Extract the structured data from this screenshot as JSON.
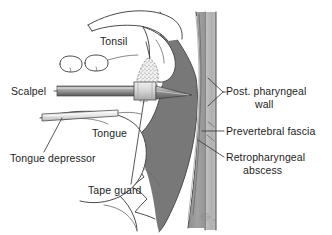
{
  "figure": {
    "background_color": "#ffffff",
    "width": 332,
    "height": 235
  },
  "colors": {
    "abscess_fill": "#787878",
    "pharyngeal_wall_fill": "#9a9a9a",
    "vertebral_band_fill": "#b4b4b4",
    "soft_tissue_fill": "#ffffff",
    "outline": "#4a4a4a",
    "leader_line": "#3a3a3a",
    "text": "#1d1d1d",
    "scalpel_handle": "#8e8e8e",
    "tape_guard": "#d8d8d8"
  },
  "labels": {
    "tonsil": "Tonsil",
    "scalpel": "Scalpel",
    "tongue": "Tongue",
    "tongue_depressor": "Tongue depressor",
    "tape_guard": "Tape guard",
    "post_pharyngeal_wall_line1": "Post. pharyngeal",
    "post_pharyngeal_wall_line2": "wall",
    "prevertebral_fascia": "Prevertebral fascia",
    "retropharyngeal_abscess_line1": "Retropharyngeal",
    "retropharyngeal_abscess_line2": "abscess"
  },
  "artifact": {
    "mark": "⇧"
  },
  "structures": [
    {
      "name": "hard-palate",
      "type": "outline"
    },
    {
      "name": "soft-palate",
      "type": "outline"
    },
    {
      "name": "uvula",
      "type": "outline"
    },
    {
      "name": "teeth",
      "type": "outline",
      "count": 2
    },
    {
      "name": "tonsil",
      "type": "stippled"
    },
    {
      "name": "tongue",
      "type": "outline"
    },
    {
      "name": "epiglottis",
      "type": "outline"
    },
    {
      "name": "posterior-pharyngeal-wall",
      "type": "filled"
    },
    {
      "name": "retropharyngeal-abscess",
      "type": "filled-dark"
    },
    {
      "name": "prevertebral-fascia",
      "type": "line"
    },
    {
      "name": "vertebral-column",
      "type": "filled-light"
    },
    {
      "name": "scalpel",
      "type": "instrument"
    },
    {
      "name": "tape-guard",
      "type": "instrument"
    },
    {
      "name": "tongue-depressor",
      "type": "instrument"
    }
  ]
}
